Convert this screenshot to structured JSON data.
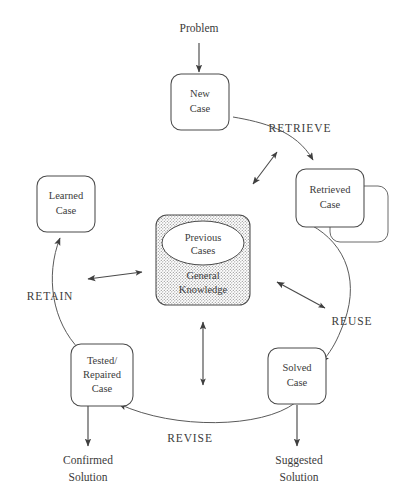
{
  "diagram": {
    "background_color": "#ffffff",
    "line_color": "#4a4a4a",
    "text_color": "#3b3b3b",
    "knowledge_fill_color": "#d8d8d8"
  },
  "io_labels": {
    "problem": "Problem",
    "confirmed_solution_line1": "Confirmed",
    "confirmed_solution_line2": "Solution",
    "suggested_solution_line1": "Suggested",
    "suggested_solution_line2": "Solution"
  },
  "nodes": [
    {
      "id": "new-case",
      "line1": "New",
      "line2": "Case"
    },
    {
      "id": "retrieved-case",
      "line1": "Retrieved",
      "line2": "Case"
    },
    {
      "id": "new-case-behind",
      "line1": "New",
      "line2": "Case"
    },
    {
      "id": "solved-case",
      "line1": "Solved",
      "line2": "Case"
    },
    {
      "id": "tested-repaired-case",
      "line1": "Tested/",
      "line2": "Repaired",
      "line3": "Case"
    },
    {
      "id": "learned-case",
      "line1": "Learned",
      "line2": "Case"
    }
  ],
  "knowledge_base": {
    "ellipse_line1": "Previous",
    "ellipse_line2": "Cases",
    "body_line1": "General",
    "body_line2": "Knowledge"
  },
  "phases": [
    {
      "id": "retrieve",
      "label": "RETRIEVE"
    },
    {
      "id": "reuse",
      "label": "REUSE"
    },
    {
      "id": "revise",
      "label": "REVISE"
    },
    {
      "id": "retain",
      "label": "RETAIN"
    }
  ]
}
